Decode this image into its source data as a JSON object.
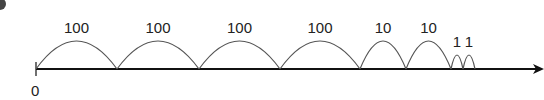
{
  "diagram": {
    "type": "number-line-jumps",
    "origin_label": "0",
    "jumps": [
      {
        "label": "100",
        "x0": 36,
        "x1": 117,
        "h": 28
      },
      {
        "label": "100",
        "x0": 117,
        "x1": 199,
        "h": 28
      },
      {
        "label": "100",
        "x0": 199,
        "x1": 280,
        "h": 28
      },
      {
        "label": "100",
        "x0": 280,
        "x1": 360,
        "h": 28
      },
      {
        "label": "10",
        "x0": 360,
        "x1": 406,
        "h": 28
      },
      {
        "label": "10",
        "x0": 406,
        "x1": 451,
        "h": 28
      },
      {
        "label": "1",
        "x0": 451,
        "x1": 463,
        "h": 14
      },
      {
        "label": "1",
        "x0": 463,
        "x1": 475,
        "h": 14
      }
    ],
    "colors": {
      "axis": "#111111",
      "arc": "#555555",
      "text": "#222222"
    }
  }
}
